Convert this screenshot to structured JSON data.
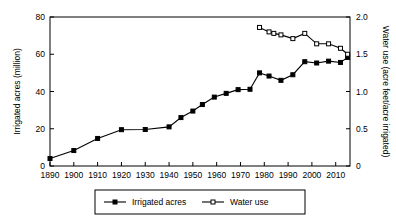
{
  "chart_data": {
    "type": "line",
    "title": "",
    "xlabel": "",
    "ylabel": "Irrigated acres (million)",
    "y2label": "Water use (acre feet/acre irrigated)",
    "grid": false,
    "legend_position": "bottom",
    "xlim": [
      1890,
      2016
    ],
    "ylim": [
      0,
      80
    ],
    "y2lim": [
      0,
      2.0
    ],
    "xticks": [
      1890,
      1900,
      1910,
      1920,
      1930,
      1940,
      1950,
      1960,
      1970,
      1980,
      1990,
      2000,
      2010
    ],
    "xticklabels": [
      "1890",
      "1900",
      "1910",
      "1920",
      "1930",
      "1940",
      "1950",
      "1960",
      "1970",
      "1980",
      "1990",
      "2000",
      "2010"
    ],
    "yticks": [
      0,
      20,
      40,
      60,
      80
    ],
    "yticklabels": [
      "0",
      "20",
      "40",
      "60",
      "80"
    ],
    "y2ticks": [
      0,
      0.5,
      1.0,
      1.5,
      2.0
    ],
    "y2ticklabels": [
      "0",
      "0.5",
      "1.0",
      "1.5",
      "2.0"
    ],
    "series": [
      {
        "name": "Irrigated acres",
        "axis": "left",
        "marker": "filled-square",
        "x": [
          1890,
          1900,
          1910,
          1920,
          1930,
          1940,
          1945,
          1950,
          1954,
          1959,
          1964,
          1969,
          1974,
          1978,
          1982,
          1987,
          1992,
          1997,
          2002,
          2007,
          2012,
          2015
        ],
        "values": [
          4.0,
          8.3,
          14.8,
          19.5,
          19.6,
          21.0,
          26.0,
          29.5,
          33.0,
          37.0,
          39.0,
          41.0,
          41.2,
          50.0,
          48.3,
          46.0,
          49.0,
          56.0,
          55.3,
          56.3,
          55.6,
          58.3
        ]
      },
      {
        "name": "Water use",
        "axis": "right",
        "marker": "open-square",
        "x": [
          1978,
          1982,
          1984,
          1987,
          1992,
          1997,
          2002,
          2007,
          2012,
          2015
        ],
        "values": [
          1.86,
          1.8,
          1.78,
          1.76,
          1.71,
          1.78,
          1.64,
          1.64,
          1.58,
          1.5
        ]
      }
    ],
    "legend": [
      {
        "label": "Irrigated acres",
        "marker": "filled-square"
      },
      {
        "label": "Water use",
        "marker": "open-square"
      }
    ]
  }
}
